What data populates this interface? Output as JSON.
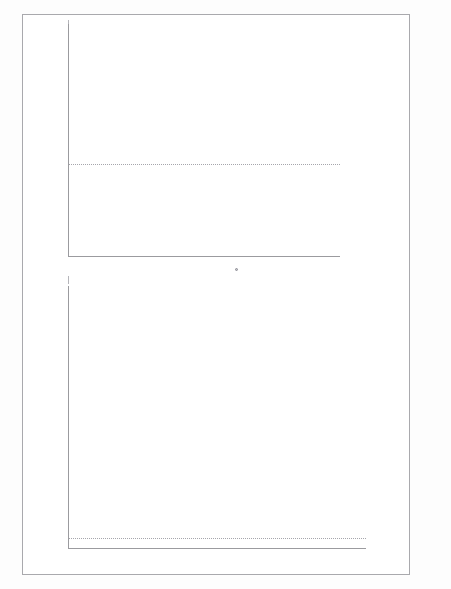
{
  "page": {
    "background_color": "#ffffff",
    "frame_color": "#a9a9ad",
    "marker_color": "#b9b9c0",
    "marker_edge_color": "#7d7d86",
    "axis_color": "#9b9b9f",
    "text_color": "#6f6f75"
  },
  "chart_data": [
    {
      "id": "top-scatter",
      "type": "scatter",
      "title": "",
      "xlabel": "",
      "ylabel": "",
      "xlim": [
        0.66,
        1.43
      ],
      "ylim": [
        -1.85,
        2.95
      ],
      "xticks": [
        "0.7",
        "0.8",
        "0.9",
        "1.0",
        "1.1",
        "1.2",
        "1.3",
        "1.4"
      ],
      "xtick_values": [
        0.7,
        0.8,
        0.9,
        1.0,
        1.1,
        1.2,
        1.3,
        1.4
      ],
      "yticks": [
        "2.5",
        "2.0",
        "1.5",
        "1.0",
        "0.5",
        "0.0",
        "-0.5",
        "-1.0",
        "-1.5"
      ],
      "ytick_values": [
        2.5,
        2.0,
        1.5,
        1.0,
        0.5,
        0.0,
        -0.5,
        -1.0,
        -1.5
      ],
      "grid": false,
      "legend": "none",
      "reference_lines": [
        {
          "orientation": "horizontal",
          "value": 0.0,
          "style": "dotted"
        }
      ],
      "points": [
        [
          1.03,
          2.88
        ],
        [
          1.0,
          2.4
        ],
        [
          1.2,
          2.43
        ],
        [
          0.89,
          1.97
        ],
        [
          1.03,
          1.94
        ],
        [
          1.2,
          2.01
        ],
        [
          0.84,
          1.77
        ],
        [
          0.94,
          1.84
        ],
        [
          1.11,
          1.73
        ],
        [
          0.99,
          1.31
        ],
        [
          1.06,
          1.16
        ],
        [
          1.15,
          1.05
        ],
        [
          1.19,
          1.12
        ],
        [
          0.79,
          1.19
        ],
        [
          0.905,
          1.1
        ],
        [
          0.91,
          1.09
        ],
        [
          1.27,
          1.0
        ],
        [
          1.31,
          0.95
        ],
        [
          1.2,
          0.84
        ],
        [
          1.19,
          0.8
        ],
        [
          1.185,
          0.75
        ],
        [
          1.18,
          0.72
        ],
        [
          1.03,
          0.8
        ],
        [
          1.12,
          0.7
        ],
        [
          1.06,
          0.65
        ],
        [
          1.14,
          0.58
        ],
        [
          0.93,
          0.51
        ],
        [
          0.99,
          0.54
        ],
        [
          1.155,
          0.46
        ],
        [
          1.16,
          0.42
        ],
        [
          1.225,
          0.47
        ],
        [
          1.23,
          0.43
        ],
        [
          1.22,
          0.4
        ],
        [
          1.145,
          0.38
        ],
        [
          1.14,
          0.34
        ],
        [
          1.175,
          0.33
        ],
        [
          1.2,
          0.3
        ],
        [
          1.135,
          0.28
        ],
        [
          1.13,
          0.24
        ],
        [
          1.125,
          0.21
        ],
        [
          1.2,
          0.19
        ],
        [
          1.205,
          0.13
        ],
        [
          1.1,
          0.1
        ],
        [
          1.105,
          0.06
        ],
        [
          1.245,
          0.09
        ],
        [
          0.955,
          0.01
        ],
        [
          0.96,
          0.0
        ],
        [
          1.4,
          0.0
        ],
        [
          0.8,
          -0.03
        ],
        [
          1.1,
          -0.01
        ],
        [
          1.0,
          -0.09
        ],
        [
          1.115,
          -0.09
        ],
        [
          1.12,
          -0.13
        ],
        [
          1.215,
          -0.06
        ],
        [
          1.225,
          -0.13
        ],
        [
          1.255,
          -0.18
        ],
        [
          1.095,
          -0.17
        ],
        [
          1.1,
          -0.21
        ],
        [
          1.205,
          -0.22
        ],
        [
          1.03,
          -0.33
        ],
        [
          1.035,
          -0.37
        ],
        [
          1.04,
          -0.41
        ],
        [
          1.045,
          -0.44
        ],
        [
          1.06,
          -0.36
        ],
        [
          1.155,
          -0.42
        ],
        [
          1.19,
          -0.43
        ],
        [
          1.2,
          -0.47
        ],
        [
          1.17,
          -0.52
        ],
        [
          1.205,
          -0.54
        ],
        [
          0.71,
          -0.5
        ],
        [
          1.3,
          -0.53
        ],
        [
          0.73,
          -0.62
        ],
        [
          1.21,
          -0.66
        ],
        [
          0.75,
          -0.84
        ],
        [
          0.89,
          -0.71
        ],
        [
          1.06,
          -0.71
        ],
        [
          1.115,
          -0.78
        ],
        [
          1.11,
          -0.83
        ],
        [
          1.15,
          -0.75
        ],
        [
          1.27,
          -0.8
        ],
        [
          0.99,
          -0.77
        ],
        [
          0.76,
          -1.19
        ],
        [
          1.28,
          -1.25
        ],
        [
          0.94,
          -1.35
        ],
        [
          0.97,
          -1.32
        ],
        [
          1.12,
          -1.3
        ],
        [
          1.15,
          -1.33
        ],
        [
          1.2,
          -1.34
        ],
        [
          1.03,
          -1.47
        ],
        [
          0.94,
          -1.51
        ],
        [
          0.68,
          -1.33
        ],
        [
          1.27,
          -1.61
        ],
        [
          1.15,
          -1.67
        ],
        [
          1.265,
          -1.83
        ],
        [
          1.27,
          -1.8
        ]
      ]
    },
    {
      "id": "bottom-scatter",
      "type": "scatter",
      "title": "",
      "xlabel": "",
      "ylabel": "",
      "xlim": [
        14380,
        17120
      ],
      "ylim": [
        -1.6,
        33.5
      ],
      "xticks": [
        "14,500",
        "15,000",
        "15,500",
        "16,000",
        "16,500",
        "17,000"
      ],
      "xtick_values": [
        14500,
        15000,
        15500,
        16000,
        16500,
        17000
      ],
      "yticks": [
        "30",
        "25",
        "20",
        "15",
        "10",
        "5",
        "0"
      ],
      "ytick_values": [
        30,
        25,
        20,
        15,
        10,
        5,
        0
      ],
      "grid": false,
      "legend": "none",
      "reference_lines": [
        {
          "orientation": "horizontal",
          "value": 0.0,
          "style": "dotted"
        }
      ],
      "outlier_points": [
        [
          16235,
          32.9
        ],
        [
          15925,
          28.4
        ],
        [
          16255,
          28.7
        ],
        [
          15145,
          20.5
        ],
        [
          15180,
          20.8
        ],
        [
          16230,
          19.6
        ],
        [
          16225,
          16.1
        ],
        [
          15285,
          9.5
        ],
        [
          15930,
          8.3
        ],
        [
          16045,
          8.3
        ],
        [
          16265,
          7.9
        ],
        [
          16250,
          6.1
        ],
        [
          15265,
          5.4
        ],
        [
          15265,
          5.1
        ],
        [
          15295,
          4.9
        ],
        [
          15960,
          5.5
        ],
        [
          16330,
          5.2
        ],
        [
          16430,
          5.6
        ],
        [
          16690,
          4.8
        ],
        [
          16745,
          5.0
        ],
        [
          16600,
          4.1
        ],
        [
          16070,
          4.9
        ],
        [
          15380,
          4.6
        ],
        [
          15520,
          4.7
        ],
        [
          15560,
          4.4
        ],
        [
          15605,
          4.5
        ],
        [
          15790,
          4.3
        ],
        [
          16215,
          4.3
        ],
        [
          15095,
          3.3
        ],
        [
          15215,
          3.3
        ],
        [
          15440,
          3.6
        ],
        [
          15495,
          3.3
        ],
        [
          15610,
          3.2
        ],
        [
          15665,
          3.4
        ],
        [
          16165,
          3.5
        ],
        [
          16230,
          3.3
        ],
        [
          16410,
          3.0
        ],
        [
          16445,
          2.3
        ],
        [
          14990,
          1.3
        ],
        [
          15045,
          1.5
        ],
        [
          14855,
          0.9
        ],
        [
          15160,
          1.8
        ],
        [
          15175,
          1.6
        ]
      ],
      "dense_band": {
        "x_start": 14820,
        "x_end": 16980,
        "y_range": [
          -0.9,
          2.4
        ],
        "approx_count": 430,
        "description": "dense overlapping cluster of residuals near zero"
      }
    }
  ]
}
